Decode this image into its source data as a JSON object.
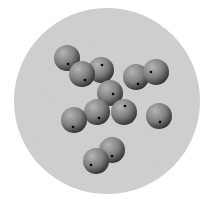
{
  "scene": {
    "width": 212,
    "height": 199,
    "background": "#ffffff",
    "disk": {
      "cx": 107,
      "cy": 101,
      "r": 93,
      "color": "#d2d2d2",
      "noise": true
    },
    "sphere_radius": 13,
    "sphere_colors": {
      "highlight": "#b4b4b4",
      "mid": "#808080",
      "shadow": "#2e2e2e"
    },
    "dot_color": "#000000",
    "dot_radius": 1.3,
    "spheres": [
      {
        "cx": 67,
        "cy": 58,
        "dx": 68,
        "dy": 64
      },
      {
        "cx": 101,
        "cy": 70,
        "dx": 102,
        "dy": 65
      },
      {
        "cx": 82,
        "cy": 74,
        "dx": 85,
        "dy": 80
      },
      {
        "cx": 136,
        "cy": 77,
        "dx": 138,
        "dy": 84
      },
      {
        "cx": 156,
        "cy": 72,
        "dx": 151,
        "dy": 72
      },
      {
        "cx": 110,
        "cy": 93,
        "dx": 113,
        "dy": 94
      },
      {
        "cx": 124,
        "cy": 112,
        "dx": 125,
        "dy": 106
      },
      {
        "cx": 97,
        "cy": 112,
        "dx": 99,
        "dy": 118
      },
      {
        "cx": 74,
        "cy": 120,
        "dx": 73,
        "dy": 127
      },
      {
        "cx": 159,
        "cy": 116,
        "dx": 160,
        "dy": 122
      },
      {
        "cx": 112,
        "cy": 150,
        "dx": 112,
        "dy": 156
      },
      {
        "cx": 96,
        "cy": 161,
        "dx": 91,
        "dy": 165
      }
    ]
  }
}
